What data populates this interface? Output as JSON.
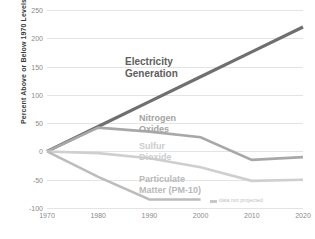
{
  "chart_data": {
    "type": "line",
    "title": "",
    "xlabel": "",
    "ylabel": "Percent Above or Below 1970 Levels",
    "x": [
      1970,
      1980,
      1990,
      2000,
      2010,
      2020
    ],
    "xticklabels": [
      "1970",
      "1980",
      "1990",
      "2000",
      "2010",
      "2020"
    ],
    "yticklabels": [
      "250",
      "200",
      "150",
      "100",
      "50",
      "0",
      "-50",
      "-100"
    ],
    "yticks": [
      250,
      200,
      150,
      100,
      50,
      0,
      -50,
      -100
    ],
    "xlim": [
      1970,
      2020
    ],
    "ylim": [
      -100,
      250
    ],
    "grid": true,
    "legend_position": "inline-labels",
    "series": [
      {
        "name": "Electricity Generation",
        "label": "Electricity\nGeneration",
        "label_line1": "Electricity",
        "label_line2": "Generation",
        "color": "#6f6f6f",
        "x": [
          1970,
          1980,
          1990,
          2000,
          2010,
          2020
        ],
        "values": [
          0,
          44,
          88,
          132,
          176,
          220
        ]
      },
      {
        "name": "Nitrogen Oxides",
        "label_line1": "Nitrogen",
        "label_line2": "Oxides",
        "color": "#a8a8a8",
        "x": [
          1970,
          1980,
          1990,
          2000,
          2010,
          2020
        ],
        "values": [
          0,
          42,
          35,
          25,
          -15,
          -10
        ]
      },
      {
        "name": "Sulfur Dioxide",
        "label_line1": "Sulfur",
        "label_line2": "Dioxide",
        "color": "#cfcfcf",
        "x": [
          1970,
          1980,
          1990,
          2000,
          2010,
          2020
        ],
        "values": [
          0,
          -3,
          -12,
          -28,
          -52,
          -50
        ]
      },
      {
        "name": "Particulate Matter (PM-10)",
        "label_line1": "Particulate",
        "label_line2": "Matter (PM-10)",
        "color": "#bcbcbc",
        "x": [
          1970,
          1980,
          1990,
          2000
        ],
        "values": [
          0,
          -45,
          -85,
          -85
        ]
      }
    ],
    "annotations": [
      {
        "text": "data not projected",
        "x": 2002,
        "y": -88
      }
    ]
  },
  "colors": {
    "background": "#ffffff",
    "gridline": "#e4e4e4",
    "tick_text": "#8a8a8a",
    "axis_title": "#3a3a3a",
    "annotation": "#c2c2c2"
  }
}
